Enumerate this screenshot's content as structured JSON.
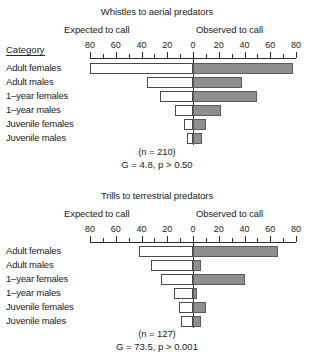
{
  "figure": {
    "categories_header": "Category",
    "axis": {
      "tick_labels": [
        "80",
        "60",
        "40",
        "20",
        "0",
        "20",
        "40",
        "60",
        "80"
      ],
      "tick_values": [
        -80,
        -60,
        -40,
        -20,
        0,
        20,
        40,
        60,
        80
      ],
      "minor_step": 10,
      "max": 80,
      "left_side_label": "Expected to call",
      "right_side_label": "Observed to call"
    },
    "row_labels": [
      "Adult females",
      "Adult males",
      "1–year females",
      "1–year males",
      "Juvenile females",
      "Juvenile males"
    ],
    "colors": {
      "expected_fill": "#ffffff",
      "observed_fill": "#8f8f8f",
      "axis": "#2b2b2b",
      "bar_outline": "#4a4a4a"
    }
  },
  "chart_data": [
    {
      "type": "bar",
      "title": "Whistles to aerial predators",
      "xlabel": "",
      "ylabel": "Category",
      "xlim": [
        -80,
        80
      ],
      "grid": false,
      "orientation": "horizontal-diverging",
      "legend_position": "top",
      "categories": [
        "Adult females",
        "Adult males",
        "1–year females",
        "1–year males",
        "Juvenile females",
        "Juvenile males"
      ],
      "series": [
        {
          "name": "Expected to call",
          "side": "left",
          "values": [
            80,
            36,
            26,
            14,
            7,
            5
          ]
        },
        {
          "name": "Observed to call",
          "side": "right",
          "values": [
            78,
            38,
            50,
            22,
            10,
            7
          ]
        }
      ],
      "annotations": {
        "sample_size": "(n = 210)",
        "statistic": "G = 4.8,  p > 0.50"
      }
    },
    {
      "type": "bar",
      "title": "Trills to terrestrial predators",
      "xlabel": "",
      "ylabel": "Category",
      "xlim": [
        -80,
        80
      ],
      "grid": false,
      "orientation": "horizontal-diverging",
      "legend_position": "top",
      "categories": [
        "Adult females",
        "Adult males",
        "1–year females",
        "1–year males",
        "Juvenile females",
        "Juvenile males"
      ],
      "series": [
        {
          "name": "Expected to call",
          "side": "left",
          "values": [
            42,
            33,
            25,
            15,
            11,
            9
          ]
        },
        {
          "name": "Observed to call",
          "side": "right",
          "values": [
            66,
            6,
            40,
            3,
            10,
            6
          ]
        }
      ],
      "annotations": {
        "sample_size": "(n = 127)",
        "statistic": "G = 73.5,  p > 0.001"
      }
    }
  ]
}
